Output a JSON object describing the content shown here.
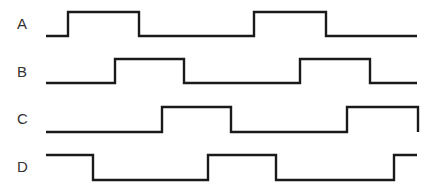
{
  "diagram": {
    "type": "timing-diagram",
    "signals": [
      {
        "name": "A",
        "label_x": 17,
        "label_y": 29,
        "high_y": 12,
        "low_y": 36,
        "x_start": 46,
        "x_end": 417,
        "initial": "low",
        "transitions": [
          68,
          139,
          254,
          326
        ],
        "end_drop": false
      },
      {
        "name": "B",
        "label_x": 17,
        "label_y": 77,
        "high_y": 59,
        "low_y": 83,
        "x_start": 46,
        "x_end": 417,
        "initial": "low",
        "transitions": [
          115,
          184,
          300,
          370
        ],
        "end_drop": false
      },
      {
        "name": "C",
        "label_x": 17,
        "label_y": 124,
        "high_y": 107,
        "low_y": 132,
        "x_start": 46,
        "x_end": 418,
        "initial": "low",
        "transitions": [
          162,
          231,
          347
        ],
        "end_drop": true
      },
      {
        "name": "D",
        "label_x": 17,
        "label_y": 172,
        "high_y": 155,
        "low_y": 180,
        "x_start": 46,
        "x_end": 417,
        "initial": "high",
        "transitions": [
          93,
          208,
          276,
          394
        ],
        "end_drop": false
      }
    ],
    "colors": {
      "line": "#1a1a1a",
      "label": "#333333",
      "background": "#ffffff"
    }
  }
}
